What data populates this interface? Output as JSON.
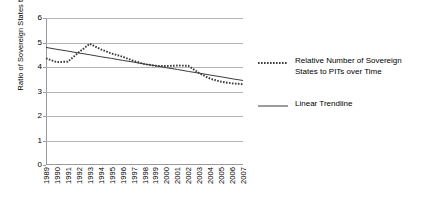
{
  "chart_data": {
    "type": "line",
    "title": "",
    "xlabel": "",
    "ylabel": "Ratio of Sovereign States to PITs",
    "ylim": [
      0,
      6
    ],
    "ytick_values": [
      0,
      1,
      2,
      3,
      4,
      5,
      6
    ],
    "ytick_labels": [
      "0",
      "1",
      "2",
      "3",
      "4",
      "5",
      "6"
    ],
    "grid": true,
    "legend_position": "right",
    "categories": [
      "1989",
      "1990",
      "1991",
      "1992",
      "1993",
      "1994",
      "1995",
      "1996",
      "1997",
      "1998",
      "1999",
      "2000",
      "2001",
      "2002",
      "2003",
      "2004",
      "2005",
      "2006",
      "2007"
    ],
    "series": [
      {
        "name": "Relative Number of Sovereign States to PITs over Time",
        "style": "dotted",
        "color": "#3b3b3b",
        "values": [
          4.35,
          4.2,
          4.22,
          4.6,
          4.95,
          4.72,
          4.55,
          4.42,
          4.25,
          4.12,
          4.05,
          4.04,
          4.06,
          4.05,
          3.75,
          3.52,
          3.4,
          3.33,
          3.3
        ]
      },
      {
        "name": "Linear Trendline",
        "style": "solid",
        "color": "#3b3b3b",
        "values": [
          4.8,
          4.72,
          4.65,
          4.57,
          4.5,
          4.42,
          4.35,
          4.27,
          4.2,
          4.12,
          4.05,
          3.97,
          3.9,
          3.82,
          3.75,
          3.67,
          3.6,
          3.52,
          3.45
        ]
      }
    ]
  },
  "legend": {
    "entries": [
      {
        "label": "Relative Number of Sovereign States to PITs over Time",
        "icon": "dotted-line-icon"
      },
      {
        "label": "Linear Trendline",
        "icon": "solid-line-icon"
      }
    ]
  },
  "axes": {
    "y_title": "Ratio of Sovereign States to PITs"
  }
}
